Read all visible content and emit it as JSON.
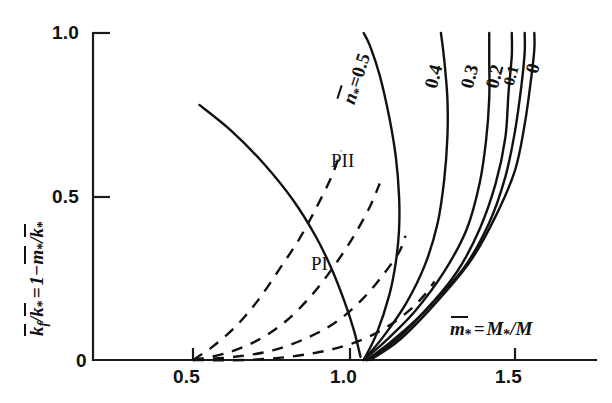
{
  "chart_data": {
    "type": "line",
    "title": "",
    "xlabel": "m̄* = M*/M",
    "ylabel": "k̄f/k̄* = 1 - m̄*/k̄*",
    "xlim": [
      0.0,
      1.65
    ],
    "ylim": [
      0.0,
      1.05
    ],
    "xticks": [
      "0",
      "0.5",
      "1.0",
      "1.5"
    ],
    "xtick_values": [
      0.0,
      0.5,
      1.0,
      1.5
    ],
    "yticks": [
      "0.5",
      "1.0"
    ],
    "ytick_values": [
      0.5,
      1.0
    ],
    "grid": false,
    "legend": "inline-curve-labels",
    "annotations": [
      "PI",
      "PII"
    ],
    "series": [
      {
        "name": "n̄* = 0.5",
        "style": "solid",
        "label": "0.5",
        "points": [
          [
            1.03,
            0.0
          ],
          [
            1.07,
            0.08
          ],
          [
            1.11,
            0.2
          ],
          [
            1.13,
            0.3
          ],
          [
            1.14,
            0.4
          ],
          [
            1.14,
            0.5
          ],
          [
            1.13,
            0.62
          ],
          [
            1.11,
            0.74
          ],
          [
            1.08,
            0.87
          ],
          [
            1.05,
            0.96
          ],
          [
            1.03,
            1.0
          ]
        ]
      },
      {
        "name": "n̄* = 0.4",
        "style": "solid",
        "label": "0.4",
        "points": [
          [
            1.03,
            0.0
          ],
          [
            1.09,
            0.07
          ],
          [
            1.16,
            0.17
          ],
          [
            1.22,
            0.29
          ],
          [
            1.26,
            0.42
          ],
          [
            1.28,
            0.55
          ],
          [
            1.29,
            0.68
          ],
          [
            1.29,
            0.8
          ],
          [
            1.28,
            0.92
          ],
          [
            1.27,
            1.0
          ]
        ]
      },
      {
        "name": "n̄* = 0.3",
        "style": "solid",
        "label": "0.3",
        "points": [
          [
            1.03,
            0.0
          ],
          [
            1.1,
            0.06
          ],
          [
            1.19,
            0.15
          ],
          [
            1.28,
            0.27
          ],
          [
            1.35,
            0.4
          ],
          [
            1.39,
            0.54
          ],
          [
            1.41,
            0.67
          ],
          [
            1.42,
            0.8
          ],
          [
            1.42,
            0.92
          ],
          [
            1.42,
            1.0
          ]
        ]
      },
      {
        "name": "n̄* = 0.2",
        "style": "solid",
        "label": "0.2",
        "points": [
          [
            1.04,
            0.0
          ],
          [
            1.12,
            0.06
          ],
          [
            1.22,
            0.15
          ],
          [
            1.32,
            0.27
          ],
          [
            1.39,
            0.4
          ],
          [
            1.44,
            0.54
          ],
          [
            1.47,
            0.68
          ],
          [
            1.48,
            0.82
          ],
          [
            1.49,
            0.93
          ],
          [
            1.49,
            1.0
          ]
        ]
      },
      {
        "name": "n̄* = 0.1",
        "style": "solid",
        "label": "0.1",
        "points": [
          [
            1.04,
            0.0
          ],
          [
            1.13,
            0.06
          ],
          [
            1.23,
            0.16
          ],
          [
            1.34,
            0.28
          ],
          [
            1.42,
            0.42
          ],
          [
            1.47,
            0.56
          ],
          [
            1.5,
            0.7
          ],
          [
            1.52,
            0.84
          ],
          [
            1.53,
            0.94
          ],
          [
            1.53,
            1.0
          ]
        ]
      },
      {
        "name": "n̄* = 0",
        "style": "solid",
        "label": "0",
        "points": [
          [
            1.05,
            0.0
          ],
          [
            1.14,
            0.06
          ],
          [
            1.25,
            0.17
          ],
          [
            1.36,
            0.3
          ],
          [
            1.44,
            0.44
          ],
          [
            1.5,
            0.58
          ],
          [
            1.53,
            0.72
          ],
          [
            1.55,
            0.86
          ],
          [
            1.56,
            0.95
          ],
          [
            1.56,
            1.0
          ]
        ]
      },
      {
        "name": "PII boundary",
        "style": "solid",
        "label": "",
        "points": [
          [
            0.52,
            0.78
          ],
          [
            0.62,
            0.7
          ],
          [
            0.72,
            0.6
          ],
          [
            0.81,
            0.49
          ],
          [
            0.88,
            0.38
          ],
          [
            0.93,
            0.28
          ],
          [
            0.97,
            0.18
          ],
          [
            1.0,
            0.09
          ],
          [
            1.02,
            0.01
          ]
        ]
      },
      {
        "name": "PI boundary a",
        "style": "dashed",
        "label": "",
        "points": [
          [
            0.5,
            0.0
          ],
          [
            0.56,
            0.04
          ],
          [
            0.63,
            0.1
          ],
          [
            0.7,
            0.18
          ],
          [
            0.77,
            0.28
          ],
          [
            0.83,
            0.37
          ],
          [
            0.88,
            0.46
          ],
          [
            0.93,
            0.56
          ],
          [
            0.96,
            0.64
          ]
        ]
      },
      {
        "name": "PI boundary b",
        "style": "dashed",
        "label": "",
        "points": [
          [
            0.5,
            0.0
          ],
          [
            0.6,
            0.02
          ],
          [
            0.7,
            0.06
          ],
          [
            0.79,
            0.12
          ],
          [
            0.87,
            0.2
          ],
          [
            0.94,
            0.29
          ],
          [
            1.0,
            0.38
          ],
          [
            1.05,
            0.47
          ],
          [
            1.08,
            0.54
          ]
        ]
      },
      {
        "name": "PI boundary c",
        "style": "dashed",
        "label": "",
        "points": [
          [
            0.5,
            0.0
          ],
          [
            0.63,
            0.01
          ],
          [
            0.75,
            0.03
          ],
          [
            0.86,
            0.07
          ],
          [
            0.95,
            0.12
          ],
          [
            1.03,
            0.19
          ],
          [
            1.09,
            0.26
          ],
          [
            1.14,
            0.33
          ],
          [
            1.16,
            0.38
          ]
        ]
      },
      {
        "name": "PI boundary d",
        "style": "dashed",
        "label": "",
        "points": [
          [
            0.5,
            0.0
          ],
          [
            0.66,
            0.0
          ],
          [
            0.8,
            0.01
          ],
          [
            0.92,
            0.03
          ],
          [
            1.02,
            0.06
          ],
          [
            1.1,
            0.1
          ],
          [
            1.17,
            0.15
          ],
          [
            1.22,
            0.2
          ],
          [
            1.25,
            0.24
          ]
        ]
      }
    ]
  },
  "axes": {
    "y_title_parts": {
      "k_f": "k",
      "sub_f": "f",
      "slash1": "/",
      "k_star_1": "k",
      "star1": "*",
      "equals": "=",
      "one": "1",
      "minus": "−",
      "m": "m",
      "star2": "*",
      "slash2": "/",
      "k_star_2": "k",
      "star3": "*"
    },
    "x_title_parts": {
      "m": "m",
      "star1": "*",
      "equals": "=",
      "M": "M",
      "star2": "*",
      "slash": "/",
      "M2": "M"
    },
    "x_tick_labels": [
      "0.5",
      "1.0",
      "1.5"
    ],
    "y_tick_labels": [
      "1.0",
      "0.5"
    ],
    "origin_label": "0"
  },
  "curve_labels": {
    "first_prefix_n": "n",
    "first_prefix_star": "*",
    "first_prefix_eq": "=",
    "items": [
      "0.5",
      "0.4",
      "0.3",
      "0.2",
      "0.1",
      "0"
    ]
  },
  "regions": {
    "p_one": "PI",
    "p_two": "PII"
  },
  "colors": {
    "ink": "#111111",
    "background": "#ffffff"
  }
}
